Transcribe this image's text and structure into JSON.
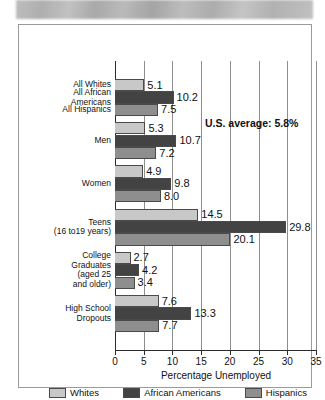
{
  "banner": {
    "type": "blurred-gray-band",
    "text": ""
  },
  "chart_data": {
    "type": "bar",
    "orientation": "horizontal",
    "title": "",
    "xlabel": "Percentage Unemployed",
    "ylabel": "",
    "xlim": [
      0,
      35
    ],
    "xticks": [
      0,
      5,
      10,
      15,
      20,
      25,
      30,
      35
    ],
    "grid": true,
    "grid_axis": "x",
    "legend_position": "bottom",
    "categories": [
      "All Whites / All African Americans / All Hispanics",
      "Men",
      "Women",
      "Teens (16 to19 years)",
      "College Graduates (aged 25 and older)",
      "High School Dropouts"
    ],
    "category_labels": [
      {
        "lines": [
          "All Whites"
        ],
        "series": "Whites"
      },
      {
        "lines": [
          "All African",
          "Americans"
        ],
        "series": "African Americans"
      },
      {
        "lines": [
          "All Hispanics"
        ],
        "series": "Hispanics"
      },
      {
        "lines": [
          "Men"
        ]
      },
      {
        "lines": [
          "Women"
        ]
      },
      {
        "lines": [
          "Teens",
          "(16 to19 years)"
        ]
      },
      {
        "lines": [
          "College",
          "Graduates",
          "(aged 25",
          "and older)"
        ]
      },
      {
        "lines": [
          "High School",
          "Dropouts"
        ]
      }
    ],
    "series": [
      {
        "name": "Whites",
        "color": "#c8c8c8",
        "values": [
          5.1,
          5.3,
          4.9,
          14.5,
          2.7,
          7.6
        ]
      },
      {
        "name": "African Americans",
        "color": "#434343",
        "values": [
          10.2,
          10.7,
          9.8,
          29.8,
          4.2,
          13.3
        ]
      },
      {
        "name": "Hispanics",
        "color": "#8e8e8e",
        "values": [
          7.5,
          7.2,
          8.0,
          20.1,
          3.4,
          7.7
        ]
      }
    ],
    "annotations": [
      {
        "text": "U.S. average: 5.8%",
        "bold": true
      }
    ]
  },
  "legend": {
    "entries": [
      {
        "label": "Whites",
        "color": "#c8c8c8"
      },
      {
        "label": "African Americans",
        "color": "#434343"
      },
      {
        "label": "Hispanics",
        "color": "#8e8e8e"
      }
    ]
  },
  "axis": {
    "title": "Percentage Unemployed",
    "ticks": [
      "0",
      "5",
      "10",
      "15",
      "20",
      "25",
      "30",
      "35"
    ]
  },
  "annotation": {
    "us_average": "U.S. average: 5.8%"
  }
}
